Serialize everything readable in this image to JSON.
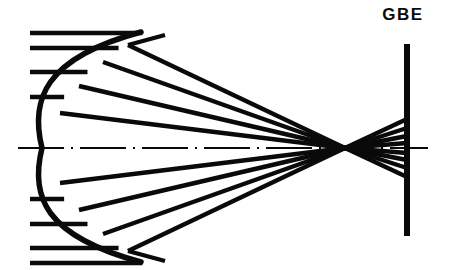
{
  "figure": {
    "width": 449,
    "height": 270,
    "background_color": "#ffffff",
    "ink_color": "#0a0a0a"
  },
  "labels": {
    "gbe": "GBE"
  },
  "chart_data": {
    "type": "diagram",
    "optical_axis": {
      "y": 148,
      "x_start": 18,
      "x_end": 428,
      "style": "dash-dot",
      "line_width": 2.2
    },
    "mirror": {
      "name": "concave-mirror",
      "shape": "arc",
      "vertex": [
        42,
        148
      ],
      "top_end": [
        141,
        32
      ],
      "bottom_end": [
        141,
        262
      ],
      "control_point": [
        12,
        148
      ],
      "line_width": 5.5,
      "orientation": "concave-right"
    },
    "focus": {
      "x": 345,
      "y": 148
    },
    "gbe_plane": {
      "name": "gbe-plane",
      "x": 407,
      "y_top": 44,
      "y_bottom": 236,
      "line_width": 6
    },
    "incoming_rays": {
      "direction": "left-to-right",
      "x_start": 30,
      "line_width": 4.4,
      "heights": [
        33,
        48,
        72,
        97,
        148,
        199,
        224,
        248,
        263
      ]
    },
    "reflected_rays": {
      "count": 8,
      "line_width": 4.4,
      "rays": [
        {
          "mirror_point": [
            128,
            45
          ],
          "focus_point": [
            345,
            148
          ],
          "screen_point": [
            407,
            177
          ]
        },
        {
          "mirror_point": [
            103,
            62
          ],
          "focus_point": [
            345,
            148
          ],
          "screen_point": [
            407,
            168
          ]
        },
        {
          "mirror_point": [
            79,
            86
          ],
          "focus_point": [
            345,
            148
          ],
          "screen_point": [
            407,
            160
          ]
        },
        {
          "mirror_point": [
            60,
            113
          ],
          "focus_point": [
            345,
            148
          ],
          "screen_point": [
            407,
            153
          ]
        },
        {
          "mirror_point": [
            60,
            183
          ],
          "focus_point": [
            345,
            148
          ],
          "screen_point": [
            407,
            143
          ]
        },
        {
          "mirror_point": [
            79,
            210
          ],
          "focus_point": [
            345,
            148
          ],
          "screen_point": [
            407,
            136
          ]
        },
        {
          "mirror_point": [
            103,
            234
          ],
          "focus_point": [
            345,
            148
          ],
          "screen_point": [
            407,
            128
          ]
        },
        {
          "mirror_point": [
            128,
            251
          ],
          "focus_point": [
            345,
            148
          ],
          "screen_point": [
            407,
            119
          ]
        }
      ]
    },
    "upper_edge_rays": [
      {
        "from": [
          128,
          45
        ],
        "to": [
          165,
          35
        ]
      },
      {
        "from": [
          128,
          251
        ],
        "to": [
          165,
          261
        ]
      }
    ]
  }
}
